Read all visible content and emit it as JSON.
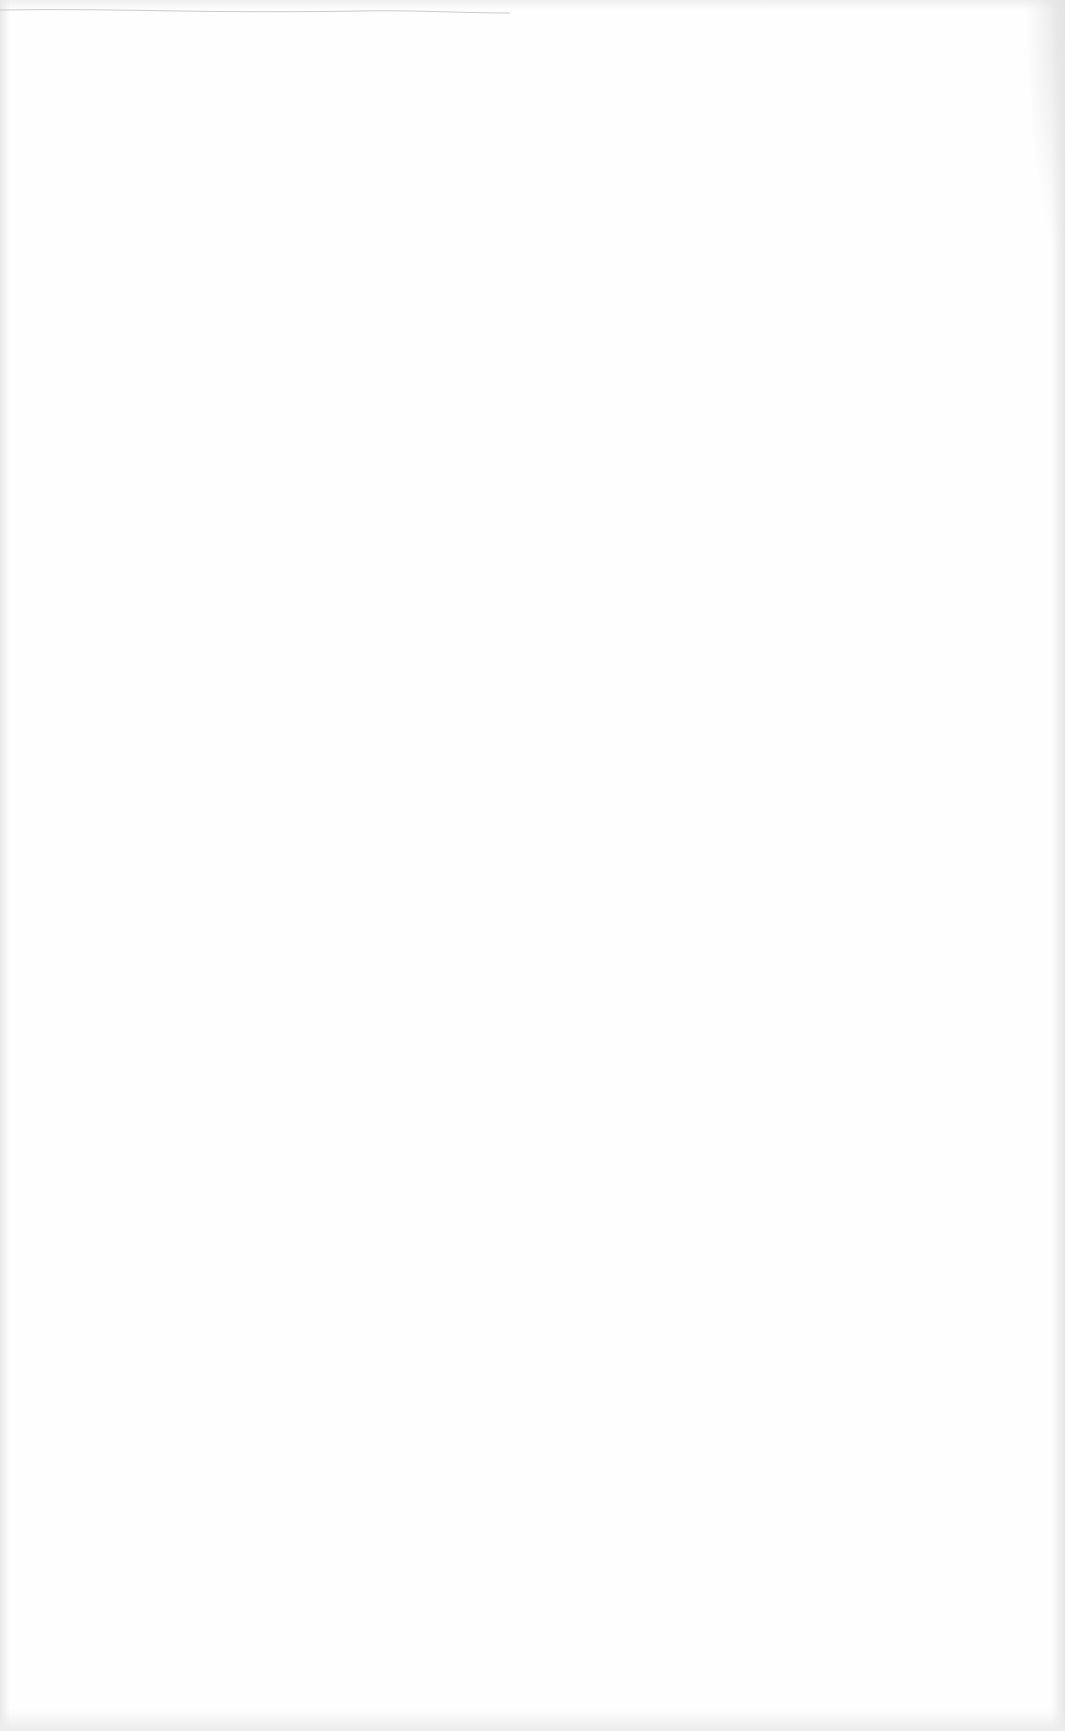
{
  "document": {
    "type": "blank scanned page",
    "text_blocks": [],
    "colors": {
      "paper": "#fefefe",
      "edge_shadow": "#e6e6e6",
      "top_rule": "#bdbdbd"
    }
  }
}
